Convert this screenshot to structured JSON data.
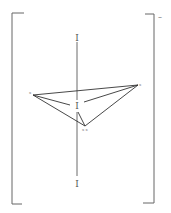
{
  "diagram": {
    "type": "chemical-structure",
    "charge": "–",
    "axis_atoms": [
      {
        "label": "I",
        "x": 77,
        "y": 38
      },
      {
        "label": "I",
        "x": 77,
        "y": 106
      },
      {
        "label": "I",
        "x": 77,
        "y": 184
      }
    ],
    "vertex_atoms": [
      {
        "label": "x",
        "x": 31,
        "y": 95
      },
      {
        "label": "x",
        "x": 140,
        "y": 85
      },
      {
        "label": "x x",
        "x": 86,
        "y": 130
      }
    ],
    "colors": {
      "line": "#444444",
      "bracket": "#555555"
    }
  }
}
